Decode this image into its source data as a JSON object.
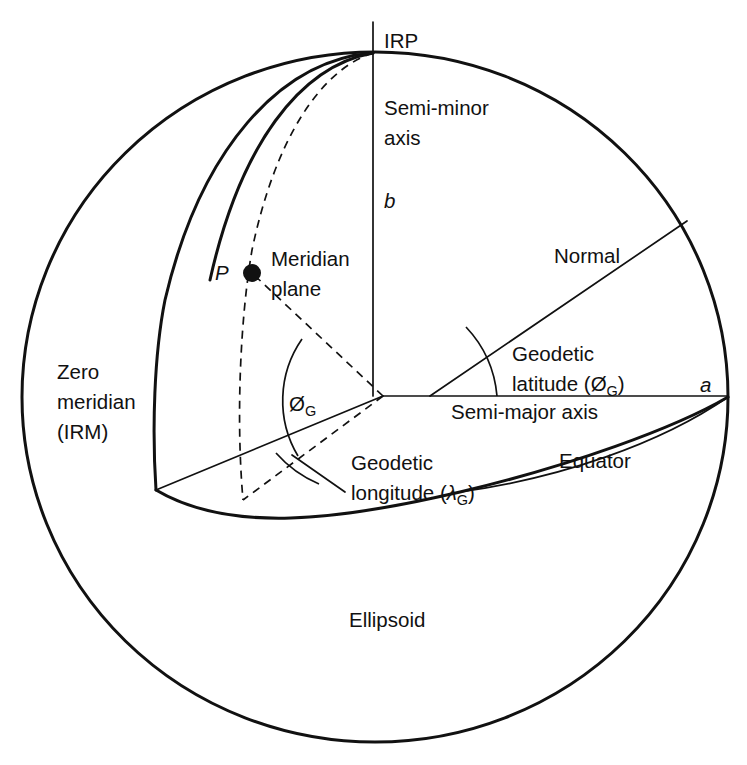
{
  "figure": {
    "background_color": "#ffffff",
    "line_color": "#111111"
  },
  "labels": {
    "irp": "IRP",
    "semi_minor_line1": "Semi-minor",
    "semi_minor_line2": "axis",
    "semi_minor_symbol": "b",
    "point_p": "P",
    "meridian_plane_line1": "Meridian",
    "meridian_plane_line2": "plane",
    "zero_meridian_line1": "Zero",
    "zero_meridian_line2": "meridian",
    "zero_meridian_line3": "(IRM)",
    "normal": "Normal",
    "geodetic_latitude_line1": "Geodetic",
    "geodetic_latitude_line2_prefix": "latitude (Ø",
    "geodetic_latitude_sub": "G",
    "geodetic_latitude_line2_suffix": ")",
    "semi_major_axis": "Semi-major axis",
    "semi_major_symbol": "a",
    "phi_symbol": "Ø",
    "phi_sub": "G",
    "geodetic_longitude_line1": "Geodetic",
    "geodetic_longitude_line2_prefix": "longitude (",
    "geodetic_longitude_lambda": "λ",
    "geodetic_longitude_sub": "G",
    "geodetic_longitude_line2_suffix": ")",
    "equator": "Equator",
    "ellipsoid": "Ellipsoid"
  },
  "geometry": {
    "sphere_center_x": 375,
    "sphere_center_y": 397,
    "sphere_radius": 352,
    "pole_x": 373,
    "pole_y": 52,
    "center_x": 383,
    "center_y": 396,
    "point_p_x": 250,
    "point_p_y": 272,
    "normal_end_x": 687,
    "normal_end_y": 220,
    "equator_right_x": 728,
    "equator_right_y": 397,
    "meridian_corner_x": 156,
    "meridian_corner_y": 490
  }
}
